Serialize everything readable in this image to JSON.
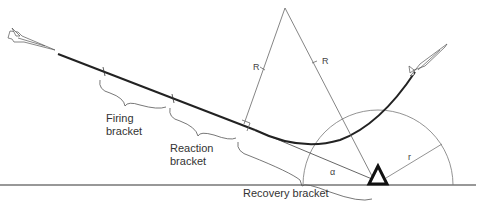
{
  "diagram": {
    "labels": {
      "firing_bracket_line1": "Firing",
      "firing_bracket_line2": "bracket",
      "reaction_bracket_line1": "Reaction",
      "reaction_bracket_line2": "bracket",
      "recovery_bracket": "Recovery bracket",
      "radius_left": "R",
      "radius_right": "R",
      "small_radius": "r",
      "angle": "α"
    },
    "elements": {
      "attacking_aircraft": "aircraft-icon",
      "escaping_aircraft": "aircraft-icon",
      "radar_site": "triangle-icon"
    },
    "colors": {
      "line": "#222222",
      "thin_line": "#666666",
      "background": "#ffffff"
    }
  }
}
